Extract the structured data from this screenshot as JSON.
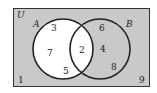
{
  "diagram": {
    "type": "venn",
    "universe_label": "U",
    "colors": {
      "universe_fill": "#c9c9c9",
      "set_a_fill": "#ffffff",
      "outline": "#222222"
    },
    "sets": [
      {
        "label": "A",
        "only": [
          "3",
          "7",
          "5"
        ]
      },
      {
        "label": "B",
        "only": [
          "6",
          "4",
          "8"
        ]
      }
    ],
    "intersection": [
      "2"
    ],
    "outside": [
      "1",
      "9"
    ]
  }
}
